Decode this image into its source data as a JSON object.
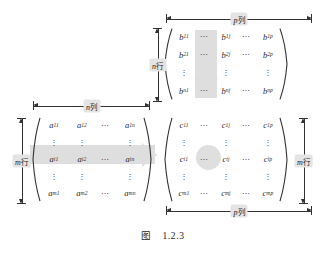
{
  "figure": {
    "caption_label": "图",
    "caption_number": "1.2.3"
  },
  "matrix_a": {
    "name": "matrix-a",
    "rows": [
      [
        {
          "base": "a",
          "sub": "11"
        },
        {
          "base": "a",
          "sub": "12"
        },
        {
          "dots": "⋯"
        },
        {
          "base": "a",
          "sub": "1n"
        }
      ],
      [
        {
          "vdots": "⋮"
        },
        {
          "vdots": "⋮"
        },
        {
          "blank": ""
        },
        {
          "vdots": "⋮"
        }
      ],
      [
        {
          "base": "a",
          "sub": "i1"
        },
        {
          "base": "a",
          "sub": "i2"
        },
        {
          "dots": "⋯"
        },
        {
          "base": "a",
          "sub": "in"
        }
      ],
      [
        {
          "vdots": "⋮"
        },
        {
          "vdots": "⋮"
        },
        {
          "blank": ""
        },
        {
          "vdots": "⋮"
        }
      ],
      [
        {
          "base": "a",
          "sub": "m1"
        },
        {
          "base": "a",
          "sub": "m2"
        },
        {
          "dots": "⋯"
        },
        {
          "base": "a",
          "sub": "mn"
        }
      ]
    ],
    "top_ruler": {
      "label_var": "n",
      "label_unit": "列"
    },
    "left_ruler": {
      "label_var": "m",
      "label_unit": "行"
    }
  },
  "matrix_b": {
    "name": "matrix-b",
    "rows": [
      [
        {
          "base": "b",
          "sub": "11"
        },
        {
          "dots": "⋯"
        },
        {
          "base": "b",
          "sub": "1j"
        },
        {
          "dots": "⋯"
        },
        {
          "base": "b",
          "sub": "1p"
        }
      ],
      [
        {
          "base": "b",
          "sub": "21"
        },
        {
          "dots": "⋯"
        },
        {
          "base": "b",
          "sub": "2j"
        },
        {
          "dots": "⋯"
        },
        {
          "base": "b",
          "sub": "2p"
        }
      ],
      [
        {
          "vdots": "⋮"
        },
        {
          "blank": ""
        },
        {
          "vdots": "⋮"
        },
        {
          "blank": ""
        },
        {
          "vdots": "⋮"
        }
      ],
      [
        {
          "base": "b",
          "sub": "n1"
        },
        {
          "dots": "⋯"
        },
        {
          "base": "b",
          "sub": "nj"
        },
        {
          "dots": "⋯"
        },
        {
          "base": "b",
          "sub": "np"
        }
      ]
    ],
    "top_ruler": {
      "label_var": "p",
      "label_unit": "列"
    },
    "left_ruler": {
      "label_var": "n",
      "label_unit": "行"
    }
  },
  "matrix_c": {
    "name": "matrix-c",
    "rows": [
      [
        {
          "base": "c",
          "sub": "11"
        },
        {
          "dots": "⋯"
        },
        {
          "base": "c",
          "sub": "1j"
        },
        {
          "dots": "⋯"
        },
        {
          "base": "c",
          "sub": "1p"
        }
      ],
      [
        {
          "vdots": "⋮"
        },
        {
          "blank": ""
        },
        {
          "vdots": "⋮"
        },
        {
          "blank": ""
        },
        {
          "vdots": "⋮"
        }
      ],
      [
        {
          "base": "c",
          "sub": "i1"
        },
        {
          "dots": "⋯"
        },
        {
          "base": "c",
          "sub": "ij"
        },
        {
          "dots": "⋯"
        },
        {
          "base": "c",
          "sub": "ip"
        }
      ],
      [
        {
          "vdots": "⋮"
        },
        {
          "blank": ""
        },
        {
          "vdots": "⋮"
        },
        {
          "blank": ""
        },
        {
          "vdots": "⋮"
        }
      ],
      [
        {
          "base": "c",
          "sub": "m1"
        },
        {
          "dots": "⋯"
        },
        {
          "base": "c",
          "sub": "mj"
        },
        {
          "dots": "⋯"
        },
        {
          "base": "c",
          "sub": "mp"
        }
      ]
    ],
    "bottom_ruler": {
      "label_var": "p",
      "label_unit": "列"
    },
    "right_ruler": {
      "label_var": "m",
      "label_unit": "行"
    }
  },
  "colors": {
    "highlight": "#dedede",
    "label_background": "#e4e4e4",
    "ink": "#2b2b2b",
    "background": "#ffffff"
  }
}
